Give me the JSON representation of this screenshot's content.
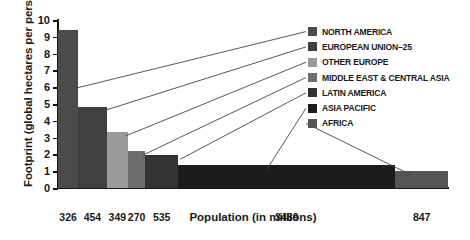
{
  "chart_data": {
    "type": "bar",
    "title": "",
    "xlabel": "Population (in millions)",
    "ylabel": "Footprint (global hectares per person)",
    "ylim": [
      0,
      10
    ],
    "yticks": [
      0,
      1,
      2,
      3,
      4,
      5,
      6,
      7,
      8,
      9,
      10
    ],
    "grid": false,
    "legend_position": "right",
    "note": "Variable-width bar chart: bar width is proportional to population, bar height is ecological footprint per person.",
    "categories": [
      "NORTH AMERICA",
      "EUROPEAN UNION–25",
      "OTHER EUROPE",
      "MIDDLE EAST & CENTRAL ASIA",
      "LATIN AMERICA",
      "ASIA PACIFIC",
      "AFRICA"
    ],
    "x_tick_labels": [
      "326",
      "454",
      "349",
      "270",
      "535",
      "3489",
      "847"
    ],
    "populations_millions": [
      326,
      454,
      349,
      270,
      535,
      3489,
      847
    ],
    "values": [
      9.4,
      4.85,
      3.35,
      2.2,
      1.95,
      1.35,
      1.0
    ],
    "series": [
      {
        "name": "Footprint (global hectares per person)",
        "values": [
          9.4,
          4.85,
          3.35,
          2.2,
          1.95,
          1.35,
          1.0
        ]
      }
    ],
    "bar_colors": [
      "#4b4b4b",
      "#3f3f3f",
      "#9a9a9a",
      "#6e6e6e",
      "#333333",
      "#1c1c1c",
      "#555555"
    ]
  },
  "legend": {
    "items": [
      {
        "label": "NORTH AMERICA",
        "color": "#4b4b4b"
      },
      {
        "label": "EUROPEAN UNION–25",
        "color": "#3f3f3f"
      },
      {
        "label": "OTHER EUROPE",
        "color": "#9a9a9a"
      },
      {
        "label": "MIDDLE EAST & CENTRAL ASIA",
        "color": "#6e6e6e"
      },
      {
        "label": "LATIN AMERICA",
        "color": "#333333"
      },
      {
        "label": "ASIA PACIFIC",
        "color": "#1c1c1c"
      },
      {
        "label": "AFRICA",
        "color": "#555555"
      }
    ]
  },
  "axes": {
    "y_title": "Footprint (global hectares per person)",
    "x_title": "Population (in millions)",
    "y_tick_labels": [
      "10",
      "9",
      "8",
      "7",
      "6",
      "5",
      "4",
      "3",
      "2",
      "1",
      "0"
    ],
    "x_tick_labels": [
      "326",
      "454",
      "349",
      "270",
      "535",
      "3489",
      "847"
    ]
  }
}
